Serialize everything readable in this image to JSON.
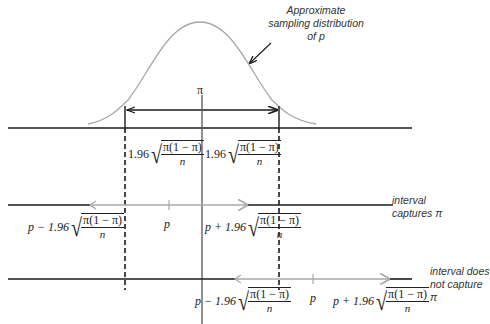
{
  "annotation": {
    "line1": "Approximate",
    "line2": "sampling distribution",
    "line3": "of p"
  },
  "symbols": {
    "pi": "π",
    "p": "p",
    "coef": "1.96",
    "minus": "−",
    "plus": "+",
    "numerator": "π(1 − π)",
    "denominator": "n",
    "radical": "√"
  },
  "labels": {
    "row1_left_margin": "1.96",
    "row1_right_margin": "1.96",
    "row2_lower": "p − 1.96",
    "row2_center": "p",
    "row2_upper": "p + 1.96",
    "row2_note_line1": "interval",
    "row2_note_line2": "captures π",
    "row3_lower": "p − 1.96",
    "row3_center": "p",
    "row3_upper": "p + 1.96",
    "row3_note_line1": "interval does",
    "row3_note_line2": "not capture π"
  },
  "colors": {
    "axis": "#1a1a1a",
    "curve": "#a8a8a8",
    "interval": "#a8a8a8",
    "dashed": "#1a1a1a"
  }
}
